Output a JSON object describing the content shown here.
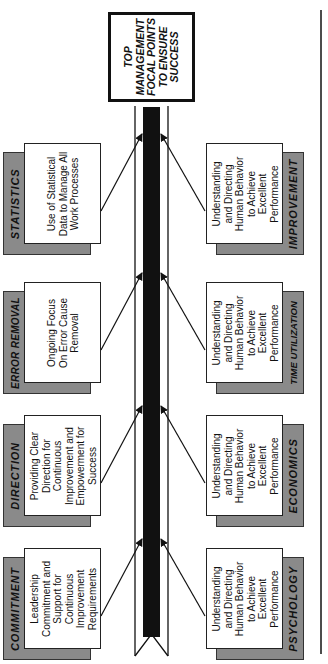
{
  "diagram": {
    "type": "fishbone",
    "orientation": "rotated-90-ccw",
    "head": {
      "lines": [
        "TOP",
        "MANAGEMENT",
        "FOCAL POINTS",
        "TO ENSURE",
        "SUCCESS"
      ]
    },
    "left_branches": [
      {
        "label": "STATISTICS",
        "text": [
          "Use of Statistical",
          "Data to Manage All",
          "Work Processes"
        ]
      },
      {
        "label": "ERROR REMOVAL",
        "text": [
          "Ongoing Focus",
          "On Error Cause",
          "Removal"
        ]
      },
      {
        "label": "DIRECTION",
        "text": [
          "Providing Clear",
          "Direction for",
          "Continuous",
          "Improvement and",
          "Empowerment for",
          "Success"
        ]
      },
      {
        "label": "COMMITMENT",
        "text": [
          "Leadership",
          "Commitment and",
          "Support for",
          "Continuous",
          "Improvement",
          "Requirements"
        ]
      }
    ],
    "right_branches": [
      {
        "label": "IMPROVEMENT",
        "text": [
          "Understanding",
          "and Directing",
          "Human Behavior",
          "to Achieve",
          "Excellent",
          "Performance"
        ]
      },
      {
        "label": "TIME UTILIZATION",
        "text": [
          "Understanding",
          "and Directing",
          "Human Behavior",
          "to Achieve",
          "Excellent",
          "Performance"
        ]
      },
      {
        "label": "ECONOMICS",
        "text": [
          "Understanding",
          "and Directing",
          "Human Behavior",
          "to Achieve",
          "Excellent",
          "Performance"
        ]
      },
      {
        "label": "PSYCHOLOGY",
        "text": [
          "Understanding",
          "and Directing",
          "Human Behavior",
          "to Achieve",
          "Excellent",
          "Performance"
        ]
      }
    ],
    "colors": {
      "label_box": "#8a8a8a",
      "spine": "#111111",
      "line": "#222222"
    }
  }
}
